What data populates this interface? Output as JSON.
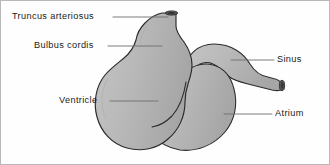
{
  "figure": {
    "background_color": "#fefefe",
    "border_color": "#b8b8b8",
    "organ_fill_color": "#b9b9b9",
    "organ_outline_color": "#2b2b2b",
    "opening_dark_color": "#4a4a4a",
    "leader_line_color": "#6e6e6e",
    "label_text_color": "#1a1a1a"
  },
  "labels": [
    {
      "id": "truncus-arteriosus",
      "text": "Truncus arteriosus",
      "side": "left",
      "points_to": "outflow tube at top of heart"
    },
    {
      "id": "bulbus-cordis",
      "text": "Bulbus cordis",
      "side": "left",
      "points_to": "upper bulbous chamber"
    },
    {
      "id": "ventricle",
      "text": "Ventricle",
      "side": "left",
      "points_to": "large lower-left chamber"
    },
    {
      "id": "sinus",
      "text": "Sinus",
      "side": "right",
      "points_to": "tube curving to the right"
    },
    {
      "id": "atrium",
      "text": "Atrium",
      "side": "right",
      "points_to": "lower-right chamber"
    }
  ]
}
